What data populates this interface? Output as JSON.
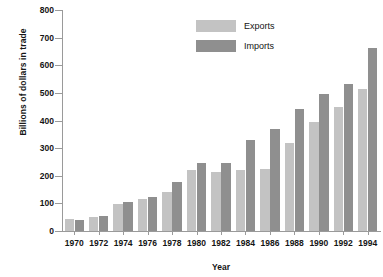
{
  "chart_data": {
    "type": "bar",
    "title": "",
    "xlabel": "Year",
    "ylabel": "Billions of dollars in trade",
    "categories": [
      "1970",
      "1972",
      "1974",
      "1976",
      "1978",
      "1980",
      "1982",
      "1984",
      "1986",
      "1988",
      "1990",
      "1992",
      "1994"
    ],
    "series": [
      {
        "name": "Exports",
        "color": "#c3c3c3",
        "values": [
          43,
          49,
          98,
          115,
          143,
          221,
          212,
          220,
          224,
          320,
          393,
          448,
          513
        ]
      },
      {
        "name": "Imports",
        "color": "#8f8f8f",
        "values": [
          40,
          56,
          104,
          124,
          176,
          245,
          247,
          328,
          368,
          441,
          495,
          532,
          663
        ]
      }
    ],
    "ylim": [
      0,
      800
    ],
    "yticks": [
      0,
      100,
      200,
      300,
      400,
      500,
      600,
      700,
      800
    ],
    "ytick_labels": [
      "0",
      "100",
      "200",
      "300",
      "400",
      "500",
      "600",
      "700",
      "800"
    ],
    "grid": false,
    "legend_position": "top-center"
  },
  "legend": {
    "entries": [
      {
        "label": "Exports",
        "swatch": "exports-swatch"
      },
      {
        "label": "Imports",
        "swatch": "imports-swatch"
      }
    ]
  },
  "axes": {
    "y_title": "Billions of dollars in trade",
    "x_title": "Year"
  }
}
